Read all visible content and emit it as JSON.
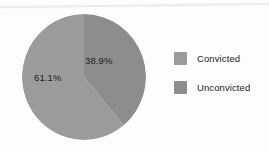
{
  "figure": {
    "background_color": "#fdfdfd"
  },
  "chart_data": {
    "type": "pie",
    "title": "",
    "categories": [
      "Convicted",
      "Unconvicted"
    ],
    "values": [
      38.9,
      61.1
    ],
    "value_labels": [
      "38.9%",
      "61.1%"
    ],
    "units": "percent",
    "start_angle_deg": 0,
    "direction": "clockwise",
    "colors": [
      "#8d8d8d",
      "#9b9b9b"
    ],
    "legend": {
      "position": "right",
      "entries": [
        {
          "label": "Convicted",
          "color": "#9b9b9b"
        },
        {
          "label": "Unconvicted",
          "color": "#8d8d8d"
        }
      ]
    },
    "grid": false,
    "xlabel": "",
    "ylabel": ""
  },
  "pie": {
    "slice_convicted_label": "38.9%",
    "slice_unconvicted_label": "61.1%",
    "slice_convicted_color": "#8d8d8d",
    "slice_unconvicted_color": "#9b9b9b"
  },
  "legend": {
    "items": [
      {
        "label": "Convicted",
        "color": "#9b9b9b"
      },
      {
        "label": "Unconvicted",
        "color": "#8d8d8d"
      }
    ]
  }
}
